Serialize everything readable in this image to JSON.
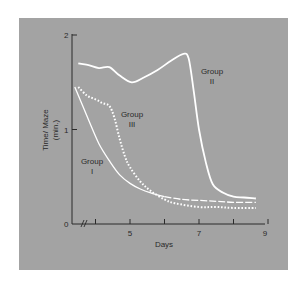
{
  "chart_data": {
    "type": "line",
    "title": "",
    "xlabel": "Days",
    "ylabel": "Time/ Maze (min.)",
    "ylabel_lines": [
      "Time/ Maze",
      "(min.)"
    ],
    "xlim": [
      3,
      9
    ],
    "ylim": [
      0,
      2
    ],
    "x_axis_break": true,
    "xticks": [
      4,
      5,
      6,
      7,
      8,
      9
    ],
    "xtick_labels": [
      {
        "value": 5,
        "label": "5"
      },
      {
        "value": 7,
        "label": "7"
      },
      {
        "value": 9,
        "label": "9"
      }
    ],
    "yticks": [
      {
        "value": 0,
        "label": "0"
      },
      {
        "value": 1,
        "label": "1"
      },
      {
        "value": 2,
        "label": "2"
      }
    ],
    "grid": false,
    "legend": "inline annotations",
    "series": [
      {
        "name": "Group I",
        "label_lines": [
          "Group",
          "I"
        ],
        "style": "solid-to-dashed",
        "color": "#ffffff",
        "x": [
          3.4,
          3.8,
          4.1,
          4.4,
          4.7,
          5.0,
          5.3,
          5.6,
          6.0,
          6.5,
          7.0,
          7.5,
          8.0,
          8.65
        ],
        "y": [
          1.45,
          1.1,
          0.85,
          0.67,
          0.52,
          0.43,
          0.37,
          0.33,
          0.29,
          0.26,
          0.25,
          0.24,
          0.23,
          0.23
        ]
      },
      {
        "name": "Group II",
        "label_lines": [
          "Group",
          "II"
        ],
        "style": "solid",
        "color": "#ffffff",
        "x": [
          3.5,
          3.8,
          4.1,
          4.4,
          4.7,
          5.05,
          5.4,
          5.8,
          6.2,
          6.55,
          6.7,
          6.85,
          7.0,
          7.2,
          7.4,
          7.7,
          8.0,
          8.3,
          8.65
        ],
        "y": [
          1.7,
          1.68,
          1.65,
          1.66,
          1.57,
          1.5,
          1.55,
          1.63,
          1.73,
          1.8,
          1.75,
          1.4,
          1.0,
          0.65,
          0.42,
          0.33,
          0.29,
          0.28,
          0.27
        ]
      },
      {
        "name": "Group III",
        "label_lines": [
          "Group",
          "III"
        ],
        "style": "dotted",
        "color": "#ffffff",
        "x": [
          3.5,
          3.75,
          4.0,
          4.2,
          4.4,
          4.55,
          4.7,
          4.85,
          5.0,
          5.3,
          5.6,
          6.0,
          6.3,
          7.0,
          7.5,
          8.0,
          8.65
        ],
        "y": [
          1.45,
          1.36,
          1.32,
          1.28,
          1.25,
          1.12,
          0.9,
          0.72,
          0.6,
          0.45,
          0.35,
          0.26,
          0.22,
          0.18,
          0.18,
          0.17,
          0.17
        ]
      }
    ]
  },
  "annotations": {
    "group1": [
      "Group",
      "I"
    ],
    "group2": [
      "Group",
      "II"
    ],
    "group3": [
      "Group",
      "III"
    ]
  },
  "colors": {
    "panel": "#a3a3a3",
    "axis": "#2a2a2a",
    "curve": "#ffffff",
    "page": "#ffffff"
  }
}
